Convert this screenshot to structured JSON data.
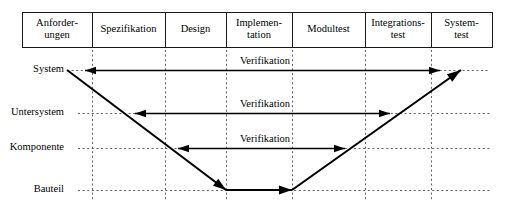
{
  "diagram": {
    "geometry": {
      "width": 514,
      "height": 207,
      "table_left": 22,
      "table_right": 492,
      "table_top": 12,
      "table_bottom": 47
    },
    "colors": {
      "background": "#ffffff",
      "stroke": "#000000",
      "grid": "#4d4d4d",
      "cell_border": "#1a1a1a",
      "text": "#000000"
    },
    "phases": [
      {
        "id": "anforderungen",
        "lines": [
          "Anforder-",
          "ungen"
        ],
        "x_start": 22,
        "x_end": 92,
        "center": 57
      },
      {
        "id": "spezifikation",
        "lines": [
          "Spezifikation"
        ],
        "x_start": 92,
        "x_end": 165,
        "center": 128.5
      },
      {
        "id": "design",
        "lines": [
          "Design"
        ],
        "x_start": 165,
        "x_end": 226,
        "center": 195.5
      },
      {
        "id": "implementation",
        "lines": [
          "Implemen-",
          "tation"
        ],
        "x_start": 226,
        "x_end": 292,
        "center": 259
      },
      {
        "id": "modultest",
        "lines": [
          "Modultest"
        ],
        "x_start": 292,
        "x_end": 365,
        "center": 328.5
      },
      {
        "id": "integrationstest",
        "lines": [
          "Integrations-",
          "test"
        ],
        "x_start": 365,
        "x_end": 431,
        "center": 398
      },
      {
        "id": "systemtest",
        "lines": [
          "System-",
          "test"
        ],
        "x_start": 431,
        "x_end": 492,
        "center": 461.5
      }
    ],
    "levels": [
      {
        "id": "system",
        "label": "System",
        "y": 70,
        "line_start": 67,
        "line_end": 490
      },
      {
        "id": "untersystem",
        "label": "Untersystem",
        "y": 113,
        "line_start": 78,
        "line_end": 490
      },
      {
        "id": "komponente",
        "label": "Komponente",
        "y": 148,
        "line_start": 78,
        "line_end": 490
      },
      {
        "id": "bauteil",
        "label": "Bauteil",
        "y": 190,
        "line_start": 78,
        "line_end": 490
      }
    ],
    "grid_verticals": [
      92,
      165,
      226,
      292,
      365,
      431
    ],
    "grid_vertical_top": 50,
    "grid_vertical_bottom": 200,
    "label_right_edge": 64,
    "v_path": {
      "descend_from_x": 67,
      "descend_from_y": 70,
      "vertex_left_x": 226,
      "vertex_y": 190,
      "vertex_right_x": 292,
      "ascend_to_x": 461,
      "ascend_to_y": 70
    },
    "verification_arrows": [
      {
        "id": "verif-system",
        "label": "Verifikation",
        "y": 70,
        "x_start": 85,
        "x_end": 440,
        "label_x": 265,
        "label_y": 64
      },
      {
        "id": "verif-untersystem",
        "label": "Verifikation",
        "y": 113,
        "x_start": 135,
        "x_end": 390,
        "label_x": 265,
        "label_y": 107
      },
      {
        "id": "verif-komponente",
        "label": "Verifikation",
        "y": 148,
        "x_start": 178,
        "x_end": 345,
        "label_x": 265,
        "label_y": 142
      }
    ]
  }
}
